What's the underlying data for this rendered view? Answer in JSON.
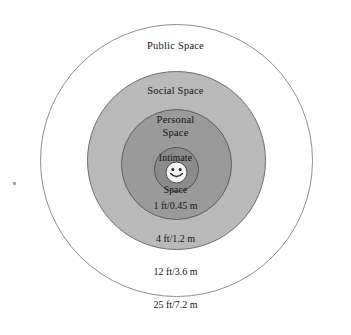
{
  "diagram": {
    "center_figure": "smiley-face-icon",
    "zones": [
      {
        "id": "public",
        "label": "Public Space",
        "distance": "25 ft/7.2 m",
        "fill": "#ffffff",
        "stroke": "#8e8e8e"
      },
      {
        "id": "social",
        "label": "Social Space",
        "distance": "12 ft/3.6 m",
        "fill": "#b9b9b9",
        "stroke": "#6f6f6f"
      },
      {
        "id": "personal",
        "label_line1": "Personal",
        "label_line2": "Space",
        "distance": "4 ft/1.2 m",
        "fill": "#9a9a9a",
        "stroke": "#5f5f5f"
      },
      {
        "id": "intimate",
        "label_line1": "Intimate",
        "label_line2": "Space",
        "distance": "1 ft/0.45 m",
        "fill": "#8b8b8b",
        "stroke": "#555555"
      }
    ]
  }
}
